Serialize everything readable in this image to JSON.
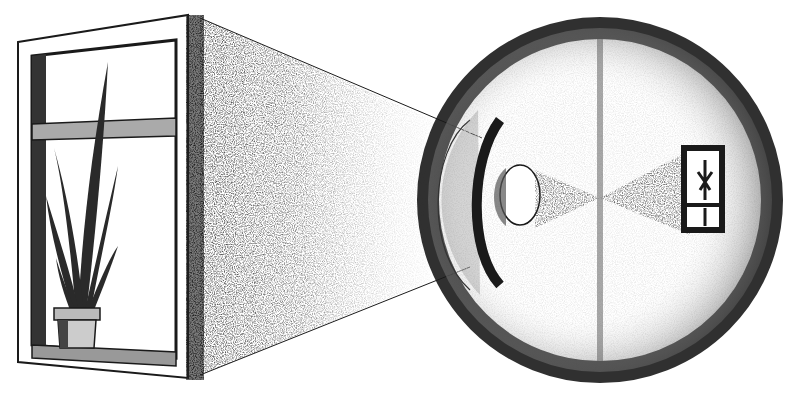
{
  "figure": {
    "elements": {
      "window": {
        "label": "window with potted plant (object)"
      },
      "eye": {
        "label": "eyeball cross-section"
      },
      "lens": {
        "label": "lens"
      },
      "retina_image": {
        "label": "inverted image on retina"
      },
      "light_rays": {
        "label": "rays from object to eye"
      }
    },
    "colors": {
      "ink": "#1a1a1a",
      "shade": "#555555",
      "paper": "#ffffff"
    }
  }
}
